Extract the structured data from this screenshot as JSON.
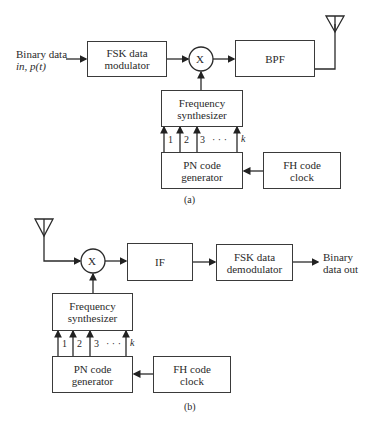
{
  "diagram_a": {
    "caption": "(a)",
    "input_label_line1": "Binary data",
    "input_label_line2": "in, p(t)",
    "fsk_modulator": {
      "line1": "FSK data",
      "line2": "modulator"
    },
    "mixer_symbol": "X",
    "bpf": "BPF",
    "freq_synth": {
      "line1": "Frequency",
      "line2": "synthesizer"
    },
    "pn_gen": {
      "line1": "PN code",
      "line2": "generator"
    },
    "fh_clock": {
      "line1": "FH code",
      "line2": "clock"
    },
    "bus_labels": [
      "1",
      "2",
      "3",
      "· · ·",
      "k"
    ]
  },
  "diagram_b": {
    "caption": "(b)",
    "mixer_symbol": "X",
    "if_box": "IF",
    "fsk_demodulator": {
      "line1": "FSK data",
      "line2": "demodulator"
    },
    "output_label_line1": "Binary",
    "output_label_line2": "data out",
    "freq_synth": {
      "line1": "Frequency",
      "line2": "synthesizer"
    },
    "pn_gen": {
      "line1": "PN code",
      "line2": "generator"
    },
    "fh_clock": {
      "line1": "FH code",
      "line2": "clock"
    },
    "bus_labels": [
      "1",
      "2",
      "3",
      "· · ·",
      "k"
    ]
  }
}
